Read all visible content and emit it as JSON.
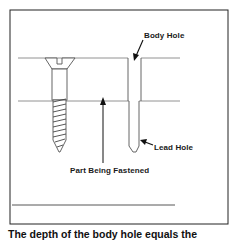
{
  "figure": {
    "labels": {
      "body_hole": "Body Hole",
      "lead_hole": "Lead Hole",
      "part_being_fastened": "Part Being Fastened"
    },
    "caption": "The depth of the body hole equals the"
  },
  "colors": {
    "line": "#555555",
    "border": "#222222",
    "text": "#1a1a1a"
  }
}
